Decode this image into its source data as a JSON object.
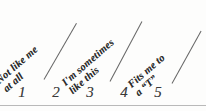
{
  "figure": {
    "type": "likert-scale-anchor-legend",
    "background_color": "#fdfdfc",
    "ink_color": "#2b2b2b",
    "rule_color": "#b9b9b9"
  },
  "anchors": [
    {
      "id": "low",
      "position_number": 1,
      "line1": "Not like me",
      "line2": "at all"
    },
    {
      "id": "middle",
      "position_number": 3,
      "line1": "I'm sometimes",
      "line2": "like this"
    },
    {
      "id": "high",
      "position_number": 5,
      "line1": "Fits me to",
      "line2": "a “T”"
    }
  ],
  "scale": {
    "numbers": [
      "1",
      "2",
      "3",
      "4",
      "5"
    ]
  },
  "chart_data": {
    "type": "table",
    "title": "",
    "categories": [
      "1",
      "2",
      "3",
      "4",
      "5"
    ],
    "values": [
      1,
      2,
      3,
      4,
      5
    ],
    "xlabel": "",
    "ylabel": "",
    "annotations": [
      "Not like me at all",
      "I'm sometimes like this",
      "Fits me to a “T”"
    ]
  }
}
